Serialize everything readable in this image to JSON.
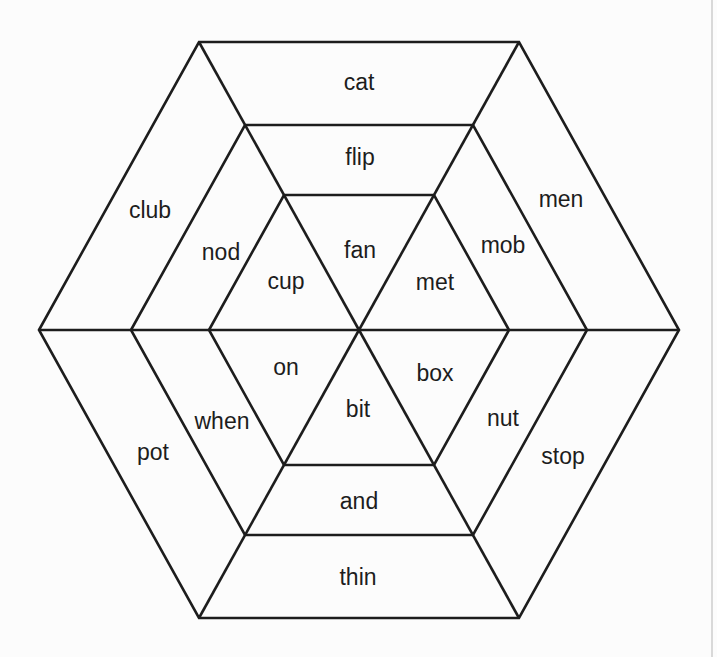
{
  "diagram": {
    "outer_ring": {
      "top": "cat",
      "upper_right": "men",
      "lower_right": "stop",
      "bottom": "thin",
      "lower_left": "pot",
      "upper_left": "club"
    },
    "middle_ring": {
      "top": "flip",
      "upper_right": "mob",
      "lower_right": "nut",
      "bottom": "and",
      "lower_left": "when",
      "upper_left": "nod"
    },
    "inner_hexagon": {
      "top": "fan",
      "upper_right": "met",
      "lower_right": "box",
      "bottom": "bit",
      "lower_left": "on",
      "upper_left": "cup"
    }
  },
  "colors": {
    "background": "#fcfcfc",
    "line": "#1d1d1d",
    "text": "#1d1d1d",
    "page_edge": "#d9d9d9"
  }
}
